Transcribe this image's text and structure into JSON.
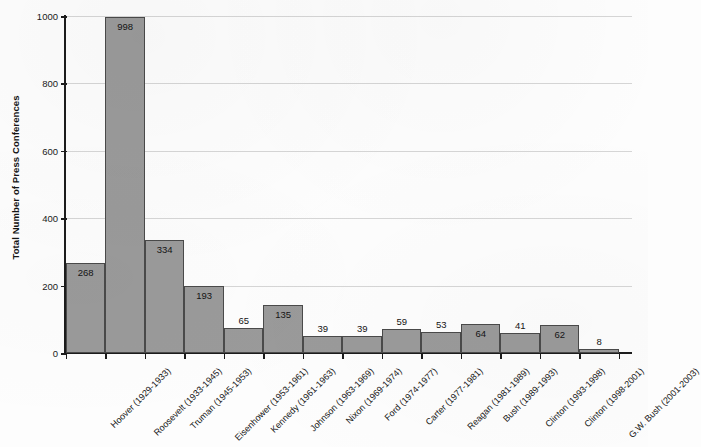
{
  "chart_data": {
    "type": "bar",
    "title": "",
    "xlabel": "",
    "ylabel": "Total Number of Press Conferences",
    "ylim": [
      0,
      1000
    ],
    "ytick_labels": [
      "0",
      "200",
      "400",
      "600",
      "800",
      "1000"
    ],
    "ytick_values": [
      0,
      200,
      400,
      600,
      800,
      1000
    ],
    "grid": true,
    "grid_axis": "y",
    "legend": "none",
    "bar_color": "#9a9a9a",
    "bar_edge_color": "#4a4a4a",
    "value_labels_shown": true,
    "categories": [
      "Hoover (1929-1933)",
      "Roosevelt (1933-1945)",
      "Truman (1945-1953)",
      "Eisenhower (1953-1961)",
      "Kennedy (1961-1963)",
      "Johnson (1963-1969)",
      "Nixon (1969-1974)",
      "Ford (1974-1977)",
      "Carter (1977-1981)",
      "Reagan (1981-1989)",
      "Bush (1989-1993)",
      "Clinton (1993-1998)",
      "Clinton (1998-2001)",
      "G.W. Bush (2001-2003)"
    ],
    "values": [
      268,
      998,
      334,
      193,
      65,
      135,
      39,
      39,
      59,
      53,
      64,
      41,
      62,
      8
    ],
    "drawn_heights": [
      268,
      998,
      334,
      200,
      75,
      143,
      50,
      50,
      72,
      62,
      85,
      60,
      83,
      12
    ]
  }
}
